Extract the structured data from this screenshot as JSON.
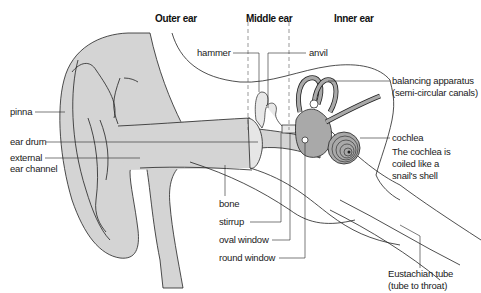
{
  "diagram": {
    "colors": {
      "tissue_fill": "#d4d4d4",
      "inner_fill": "#a9a9a9",
      "line": "#222222",
      "background": "#ffffff"
    },
    "section_headers": [
      {
        "id": "outer",
        "text": "Outer ear"
      },
      {
        "id": "middle",
        "text": "Middle ear"
      },
      {
        "id": "inner",
        "text": "Inner ear"
      }
    ],
    "labels": {
      "pinna": "pinna",
      "ear_drum": "ear drum",
      "external_1": "external",
      "external_2": "ear channel",
      "hammer": "hammer",
      "anvil": "anvil",
      "balancing_1": "balancing apparatus",
      "balancing_2": "(semi-circular canals)",
      "cochlea": "cochlea",
      "cochlea_note_1": "The cochlea is",
      "cochlea_note_2": "coiled like a",
      "cochlea_note_3": "snail's shell",
      "bone": "bone",
      "stirrup": "stirrup",
      "oval_window": "oval window",
      "round_window": "round window",
      "eustachian_1": "Eustachian tube",
      "eustachian_2": "(tube to throat)"
    }
  }
}
